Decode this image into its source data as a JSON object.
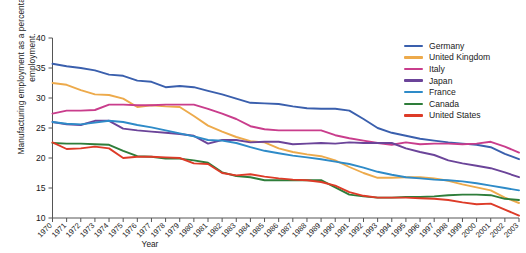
{
  "chart_data": {
    "type": "line",
    "title": "",
    "xlabel": "Year",
    "ylabel": "Manufacturing employment as a percentage of total employment.",
    "xlim": [
      1970,
      2003
    ],
    "ylim": [
      10,
      40
    ],
    "yticks": [
      10,
      15,
      20,
      25,
      30,
      35,
      40
    ],
    "grid": false,
    "legend_position": "top-right",
    "x": [
      1970,
      1971,
      1972,
      1973,
      1974,
      1975,
      1976,
      1977,
      1978,
      1979,
      1980,
      1981,
      1982,
      1983,
      1984,
      1985,
      1986,
      1987,
      1988,
      1989,
      1990,
      1991,
      1992,
      1993,
      1994,
      1995,
      1996,
      1997,
      1998,
      1999,
      2000,
      2001,
      2002,
      2003
    ],
    "categories": [
      "1970",
      "1971",
      "1972",
      "1973",
      "1974",
      "1975",
      "1976",
      "1977",
      "1978",
      "1979",
      "1980",
      "1981",
      "1982",
      "1983",
      "1984",
      "1985",
      "1986",
      "1987",
      "1988",
      "1989",
      "1990",
      "1991",
      "1992",
      "1993",
      "1994",
      "1995",
      "1996",
      "1997",
      "1998",
      "1999",
      "2000",
      "2001",
      "2002",
      "2003"
    ],
    "series": [
      {
        "name": "Germany",
        "color": "#3a5fad",
        "values": [
          35.7,
          35.3,
          35.0,
          34.6,
          33.9,
          33.7,
          32.9,
          32.7,
          31.8,
          32.0,
          31.8,
          31.2,
          30.6,
          29.9,
          29.2,
          29.1,
          29.0,
          28.6,
          28.3,
          28.2,
          28.2,
          27.9,
          26.5,
          25.0,
          24.2,
          23.7,
          23.2,
          22.9,
          22.6,
          22.4,
          22.2,
          21.8,
          20.7,
          19.8
        ]
      },
      {
        "name": "United Kingdom",
        "color": "#edaa4b",
        "values": [
          32.5,
          32.2,
          31.3,
          30.6,
          30.5,
          29.9,
          28.5,
          28.8,
          28.6,
          28.5,
          27.0,
          25.4,
          24.4,
          23.5,
          22.8,
          22.6,
          21.6,
          21.0,
          20.6,
          20.3,
          19.6,
          18.5,
          17.5,
          16.7,
          16.7,
          16.8,
          16.8,
          16.6,
          16.2,
          15.6,
          15.1,
          14.6,
          13.4,
          12.5
        ]
      },
      {
        "name": "Italy",
        "color": "#c93d8c",
        "values": [
          27.4,
          27.9,
          27.9,
          28.0,
          28.9,
          28.9,
          28.8,
          28.8,
          28.9,
          28.9,
          28.9,
          28.2,
          27.4,
          26.5,
          25.3,
          24.8,
          24.6,
          24.6,
          24.6,
          24.6,
          23.8,
          23.3,
          22.9,
          22.5,
          22.2,
          22.6,
          22.3,
          22.4,
          22.4,
          22.3,
          22.4,
          22.7,
          21.9,
          20.9
        ]
      },
      {
        "name": "Japan",
        "color": "#6b4499",
        "values": [
          26.0,
          25.6,
          25.5,
          26.2,
          26.2,
          24.9,
          24.6,
          24.4,
          24.2,
          24.0,
          23.7,
          22.4,
          23.0,
          23.0,
          22.6,
          22.7,
          22.7,
          22.3,
          22.4,
          22.5,
          22.4,
          22.6,
          22.5,
          22.5,
          22.5,
          21.6,
          21.0,
          20.5,
          19.6,
          19.1,
          18.7,
          18.3,
          17.6,
          16.8
        ]
      },
      {
        "name": "France",
        "color": "#2e8bc8",
        "values": [
          26.0,
          25.7,
          25.6,
          25.9,
          26.2,
          26.0,
          25.5,
          25.1,
          24.6,
          24.1,
          23.6,
          23.0,
          22.9,
          22.5,
          21.8,
          21.2,
          20.8,
          20.4,
          20.1,
          19.8,
          19.4,
          19.0,
          18.4,
          17.7,
          17.2,
          16.8,
          16.6,
          16.4,
          16.3,
          16.1,
          15.8,
          15.4,
          15.0,
          14.6
        ]
      },
      {
        "name": "Canada",
        "color": "#2e7d3a",
        "values": [
          22.5,
          22.4,
          22.4,
          22.3,
          22.2,
          21.2,
          20.3,
          20.2,
          19.9,
          19.9,
          19.6,
          19.2,
          17.6,
          17.0,
          16.8,
          16.3,
          16.3,
          16.3,
          16.3,
          16.3,
          15.1,
          13.9,
          13.6,
          13.4,
          13.4,
          13.5,
          13.5,
          13.6,
          13.8,
          13.9,
          13.9,
          13.8,
          13.2,
          13.0
        ]
      },
      {
        "name": "United States",
        "color": "#dd3b28",
        "values": [
          22.6,
          21.5,
          21.6,
          21.9,
          21.6,
          20.0,
          20.2,
          20.2,
          20.1,
          20.0,
          19.1,
          19.0,
          17.5,
          17.1,
          17.3,
          16.9,
          16.6,
          16.4,
          16.3,
          16.0,
          15.4,
          14.3,
          13.7,
          13.4,
          13.4,
          13.4,
          13.3,
          13.2,
          13.0,
          12.6,
          12.3,
          12.4,
          11.4,
          10.4
        ]
      }
    ]
  },
  "axis": {
    "y_tick_labels": [
      "10",
      "15",
      "20",
      "25",
      "30",
      "35",
      "40"
    ],
    "x_tick_labels": [
      "1970",
      "1971",
      "1972",
      "1973",
      "1974",
      "1975",
      "1976",
      "1977",
      "1978",
      "1979",
      "1980",
      "1981",
      "1982",
      "1983",
      "1984",
      "1985",
      "1986",
      "1987",
      "1988",
      "1989",
      "1990",
      "1991",
      "1992",
      "1993",
      "1994",
      "1995",
      "1996",
      "1997",
      "1998",
      "1999",
      "2000",
      "2001",
      "2002",
      "2003"
    ],
    "x_axis_title": "Year",
    "y_axis_title": "Manufacturing employment as a percentage of total employment."
  },
  "legend": {
    "items": [
      {
        "label": "Germany",
        "color": "#3a5fad"
      },
      {
        "label": "United Kingdom",
        "color": "#edaa4b"
      },
      {
        "label": "Italy",
        "color": "#c93d8c"
      },
      {
        "label": "Japan",
        "color": "#6b4499"
      },
      {
        "label": "France",
        "color": "#2e8bc8"
      },
      {
        "label": "Canada",
        "color": "#2e7d3a"
      },
      {
        "label": "United States",
        "color": "#dd3b28"
      }
    ]
  }
}
